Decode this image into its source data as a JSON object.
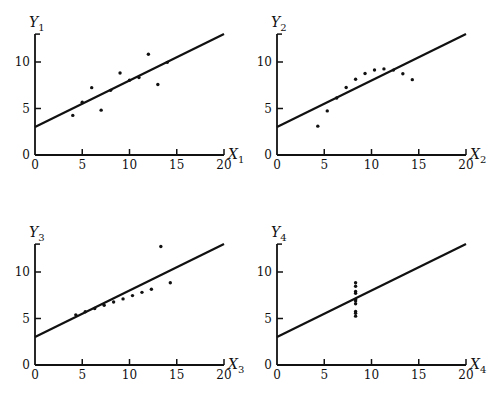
{
  "chart_data": [
    {
      "type": "scatter",
      "title": "",
      "xlabel": "X1",
      "xlabel_main": "X",
      "xlabel_sub": "1",
      "ylabel": "Y1",
      "ylabel_main": "Y",
      "ylabel_sub": "1",
      "xlim": [
        0,
        20
      ],
      "ylim": [
        0,
        13
      ],
      "xticks": [
        0,
        5,
        10,
        15,
        20
      ],
      "yticks": [
        0,
        5,
        10
      ],
      "grid": false,
      "x": [
        10,
        8,
        13,
        9,
        11,
        14,
        6,
        4,
        12,
        7,
        5
      ],
      "y": [
        8.04,
        6.95,
        7.58,
        8.81,
        8.33,
        9.96,
        7.24,
        4.26,
        10.84,
        4.82,
        5.68
      ],
      "fit_line": {
        "intercept": 3.0,
        "slope": 0.5
      }
    },
    {
      "type": "scatter",
      "title": "",
      "xlabel": "X2",
      "xlabel_main": "X",
      "xlabel_sub": "2",
      "ylabel": "Y2",
      "ylabel_main": "Y",
      "ylabel_sub": "2",
      "xlim": [
        0,
        20
      ],
      "ylim": [
        0,
        13
      ],
      "xticks": [
        0,
        5,
        10,
        15,
        20
      ],
      "yticks": [
        0,
        5,
        10
      ],
      "grid": false,
      "x": [
        10,
        8,
        13,
        9,
        11,
        14,
        6,
        4,
        12,
        7,
        5
      ],
      "y": [
        9.14,
        8.14,
        8.74,
        8.77,
        9.26,
        8.1,
        6.13,
        3.1,
        9.13,
        7.26,
        4.74
      ],
      "fit_line": {
        "intercept": 3.0,
        "slope": 0.5
      }
    },
    {
      "type": "scatter",
      "title": "",
      "xlabel": "X3",
      "xlabel_main": "X",
      "xlabel_sub": "3",
      "ylabel": "Y3",
      "ylabel_main": "Y",
      "ylabel_sub": "3",
      "xlim": [
        0,
        20
      ],
      "ylim": [
        0,
        13
      ],
      "xticks": [
        0,
        5,
        10,
        15,
        20
      ],
      "yticks": [
        0,
        5,
        10
      ],
      "grid": false,
      "x": [
        10,
        8,
        13,
        9,
        11,
        14,
        6,
        4,
        12,
        7,
        5
      ],
      "y": [
        7.46,
        6.77,
        12.74,
        7.11,
        7.81,
        8.84,
        6.08,
        5.39,
        8.15,
        6.42,
        5.73
      ],
      "fit_line": {
        "intercept": 3.0,
        "slope": 0.5
      }
    },
    {
      "type": "scatter",
      "title": "",
      "xlabel": "X4",
      "xlabel_main": "X",
      "xlabel_sub": "4",
      "ylabel": "Y4",
      "ylabel_main": "Y",
      "ylabel_sub": "4",
      "xlim": [
        0,
        20
      ],
      "ylim": [
        0,
        13
      ],
      "xticks": [
        0,
        5,
        10,
        15,
        20
      ],
      "yticks": [
        0,
        5,
        10
      ],
      "grid": false,
      "x": [
        8,
        8,
        8,
        8,
        8,
        8,
        8,
        19,
        8,
        8,
        8
      ],
      "y": [
        6.58,
        5.76,
        7.71,
        8.84,
        8.47,
        7.04,
        5.25,
        12.5,
        5.56,
        7.91,
        6.89
      ],
      "fit_line": {
        "intercept": 3.0,
        "slope": 0.5
      }
    }
  ]
}
